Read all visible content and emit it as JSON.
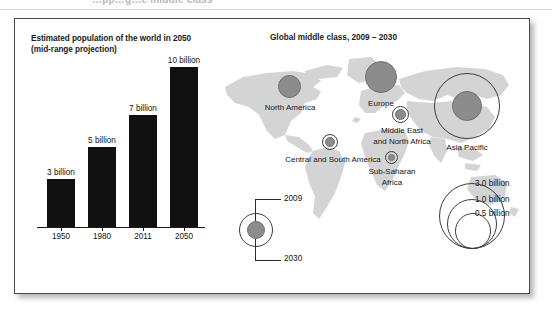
{
  "page_header": {
    "text": "…pp…g…e middle class"
  },
  "bar_chart_panel": {
    "title_line1": "Estimated population of the world in 2050",
    "title_line2": "(mid-range projection)"
  },
  "map_panel": {
    "title": "Global middle class, 2009 – 2030",
    "regions": [
      {
        "name": "North America",
        "label": "North America"
      },
      {
        "name": "Europe",
        "label": "Europe"
      },
      {
        "name": "Middle East and North Africa",
        "label": "Middle East\nand North Africa",
        "label_line1": "Middle East",
        "label_line2": "and North Africa"
      },
      {
        "name": "Asia Pacific",
        "label": "Asia Pacific"
      },
      {
        "name": "Central and South America",
        "label": "Central and South America"
      },
      {
        "name": "Sub-Saharan Africa",
        "label": "Sub-Saharan\nAfrica",
        "label_line1": "Sub-Saharan",
        "label_line2": "Africa"
      }
    ],
    "year_key": {
      "inner_label": "2009",
      "outer_label": "2030"
    },
    "size_key": {
      "labels": [
        "3.0 billion",
        "1.0 billion",
        "0.5 billion"
      ],
      "large": "3.0 billion",
      "medium": "1.0 billion",
      "small": "0.5 billion"
    }
  },
  "colors": {
    "bubble_fill": "#8c8c8c",
    "bubble_stroke": "#6f6f6f",
    "ring_stroke": "#3d3d3d",
    "bar_fill": "#111111",
    "land_fill": "#d4d4d4",
    "panel_border": "#4a4a4a",
    "text": "#141414"
  },
  "chart_data": [
    {
      "type": "bar",
      "title": "Estimated population of the world in 2050 (mid-range projection)",
      "xlabel": "",
      "ylabel": "",
      "categories": [
        "1950",
        "1980",
        "2011",
        "2050"
      ],
      "values": [
        3,
        5,
        7,
        10
      ],
      "value_labels": [
        "3 billion",
        "5 billion",
        "7 billion",
        "10 billion"
      ],
      "unit": "billion people",
      "ylim": [
        0,
        10
      ],
      "grid": false,
      "legend": "none"
    },
    {
      "type": "scatter",
      "subtype": "proportional-symbol-map",
      "title": "Global middle class, 2009 – 2030",
      "xlabel": "",
      "ylabel": "",
      "legend": "bottom-right",
      "size_legend": {
        "values": [
          3.0,
          1.0,
          0.5
        ],
        "unit": "billion",
        "labels": [
          "3.0 billion",
          "1.0 billion",
          "0.5 billion"
        ]
      },
      "series": [
        {
          "name": "2009",
          "encoding": "filled grey circle"
        },
        {
          "name": "2030",
          "encoding": "outlined circle"
        }
      ],
      "points": [
        {
          "region": "North America",
          "series_2009": 0.34,
          "series_2030": 0.32,
          "x": 75,
          "y": 50
        },
        {
          "region": "Europe",
          "series_2009": 0.66,
          "series_2030": 0.68,
          "x": 166,
          "y": 38
        },
        {
          "region": "Central and South America",
          "series_2009": 0.18,
          "series_2030": 0.31,
          "x": 117,
          "y": 106
        },
        {
          "region": "Middle East and North Africa",
          "series_2009": 0.14,
          "series_2030": 0.23,
          "x": 186,
          "y": 82
        },
        {
          "region": "Sub-Saharan Africa",
          "series_2009": 0.04,
          "series_2030": 0.11,
          "x": 176,
          "y": 126
        },
        {
          "region": "Asia Pacific",
          "series_2009": 0.7,
          "series_2030": 3.23,
          "x": 252,
          "y": 72
        }
      ]
    }
  ]
}
